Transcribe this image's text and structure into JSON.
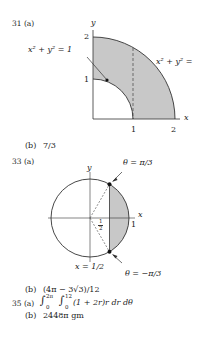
{
  "problems": [
    {
      "number": "31",
      "part_a_label": "31 (a)",
      "figure": {
        "axis_y": "y",
        "axis_x": "x",
        "tick_y": [
          "2",
          "1"
        ],
        "tick_x": [
          "1",
          "2"
        ],
        "label_inner": "x² + y² = 1",
        "label_outer": "x² + y² ="
      },
      "part_b_label": "(b)",
      "part_b_answer": "7/3"
    },
    {
      "number": "33",
      "part_a_label": "33 (a)",
      "figure": {
        "axis_y": "y",
        "axis_x": "x",
        "tick_x": "1",
        "half_label_num": "1",
        "half_label_den": "2",
        "label_top": "θ = π/3",
        "label_bottom": "θ = −π/3",
        "label_line": "x = 1/2"
      },
      "part_b_label": "(b)",
      "part_b_answer": "(4π − 3√3)/12"
    },
    {
      "number": "35",
      "part_a_label": "35 (a)",
      "part_a_answer": {
        "outer_upper": "2π",
        "outer_lower": "0",
        "inner_upper": "12",
        "inner_lower": "0",
        "integrand": "(1 + 2r)r dr dθ"
      },
      "part_b_label": "(b)",
      "part_b_answer": "2448π gm"
    }
  ]
}
